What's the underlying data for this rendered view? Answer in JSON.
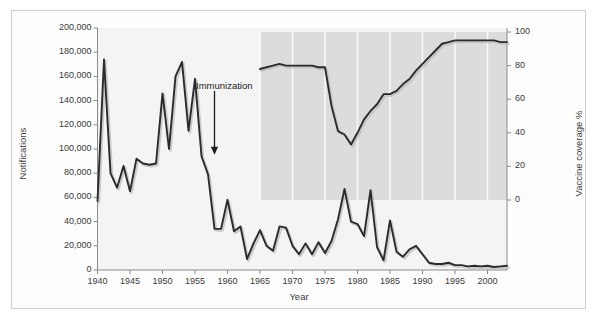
{
  "figure": {
    "background": "#ffffff",
    "border_color": "#cfcfcf",
    "band_color": "#dcdcdc",
    "plot_bg": "#f4f4f4",
    "line_color": "#2b2b2b"
  },
  "chart_data": {
    "type": "line",
    "title": "",
    "xlabel": "Year",
    "ylabel": "Notifications",
    "y2label": "Vaccine coverage %",
    "xlim": [
      1940,
      2003
    ],
    "ylim": [
      0,
      200000
    ],
    "y2lim": [
      0,
      100
    ],
    "grid": false,
    "xticks": [
      1940,
      1945,
      1950,
      1955,
      1960,
      1965,
      1970,
      1975,
      1980,
      1985,
      1990,
      1995,
      2000
    ],
    "yticks": [
      0,
      20000,
      40000,
      60000,
      80000,
      100000,
      120000,
      140000,
      160000,
      180000,
      200000
    ],
    "ytick_labels": [
      "0",
      "20,000",
      "40,000",
      "60,000",
      "80,000",
      "100,000",
      "120,000",
      "140,000",
      "160,000",
      "180,000",
      "200,000"
    ],
    "y2ticks": [
      0,
      20,
      40,
      60,
      80,
      100
    ],
    "y2tick_labels": [
      "0",
      "20",
      "40",
      "60",
      "80",
      "100"
    ],
    "shaded_band": {
      "x_start": 1965,
      "x_end": 2003,
      "y2_start": 0,
      "y2_end": 100,
      "note": "grey band behind vaccine coverage series"
    },
    "annotations": [
      {
        "text": "Immunization",
        "x": 1958,
        "y": 148000,
        "arrow_to_x": 1958,
        "arrow_to_y": 97000
      }
    ],
    "legend_position": "none",
    "series": [
      {
        "name": "Notifications",
        "axis": "left",
        "x": [
          1940,
          1941,
          1942,
          1943,
          1944,
          1945,
          1946,
          1947,
          1948,
          1949,
          1950,
          1951,
          1952,
          1953,
          1954,
          1955,
          1956,
          1957,
          1958,
          1959,
          1960,
          1961,
          1962,
          1963,
          1964,
          1965,
          1966,
          1967,
          1968,
          1969,
          1970,
          1971,
          1972,
          1973,
          1974,
          1975,
          1976,
          1977,
          1978,
          1979,
          1980,
          1981,
          1982,
          1983,
          1984,
          1985,
          1986,
          1987,
          1988,
          1989,
          1990,
          1991,
          1992,
          1993,
          1994,
          1995,
          1996,
          1997,
          1998,
          1999,
          2000,
          2001,
          2002,
          2003
        ],
        "values": [
          57000,
          174000,
          80000,
          68000,
          86000,
          65000,
          92000,
          88000,
          87000,
          88000,
          146000,
          100000,
          160000,
          172000,
          115000,
          158000,
          94000,
          79000,
          34000,
          34000,
          58000,
          32000,
          36000,
          9000,
          22000,
          33000,
          20000,
          16000,
          36000,
          35000,
          20000,
          13000,
          22000,
          13000,
          23000,
          14000,
          24000,
          42000,
          67000,
          40000,
          38000,
          28000,
          66000,
          19000,
          8000,
          41000,
          15000,
          11000,
          17000,
          20000,
          13000,
          6000,
          5000,
          5000,
          6000,
          4000,
          4000,
          3000,
          3500,
          3000,
          3500,
          2500,
          3000,
          3500
        ]
      },
      {
        "name": "Vaccine coverage %",
        "axis": "right",
        "x": [
          1965,
          1966,
          1967,
          1968,
          1969,
          1970,
          1971,
          1972,
          1973,
          1974,
          1975,
          1976,
          1977,
          1978,
          1979,
          1980,
          1981,
          1982,
          1983,
          1984,
          1985,
          1986,
          1987,
          1988,
          1989,
          1990,
          1991,
          1992,
          1993,
          1994,
          1995,
          1996,
          1997,
          1998,
          1999,
          2000,
          2001,
          2002,
          2003
        ],
        "values": [
          78,
          79,
          80,
          81,
          80,
          80,
          80,
          80,
          80,
          79,
          79,
          56,
          41,
          39,
          33,
          40,
          48,
          53,
          57,
          63,
          63,
          65,
          69,
          72,
          77,
          81,
          85,
          89,
          93,
          94,
          95,
          95,
          95,
          95,
          95,
          95,
          95,
          94,
          94
        ]
      }
    ]
  }
}
